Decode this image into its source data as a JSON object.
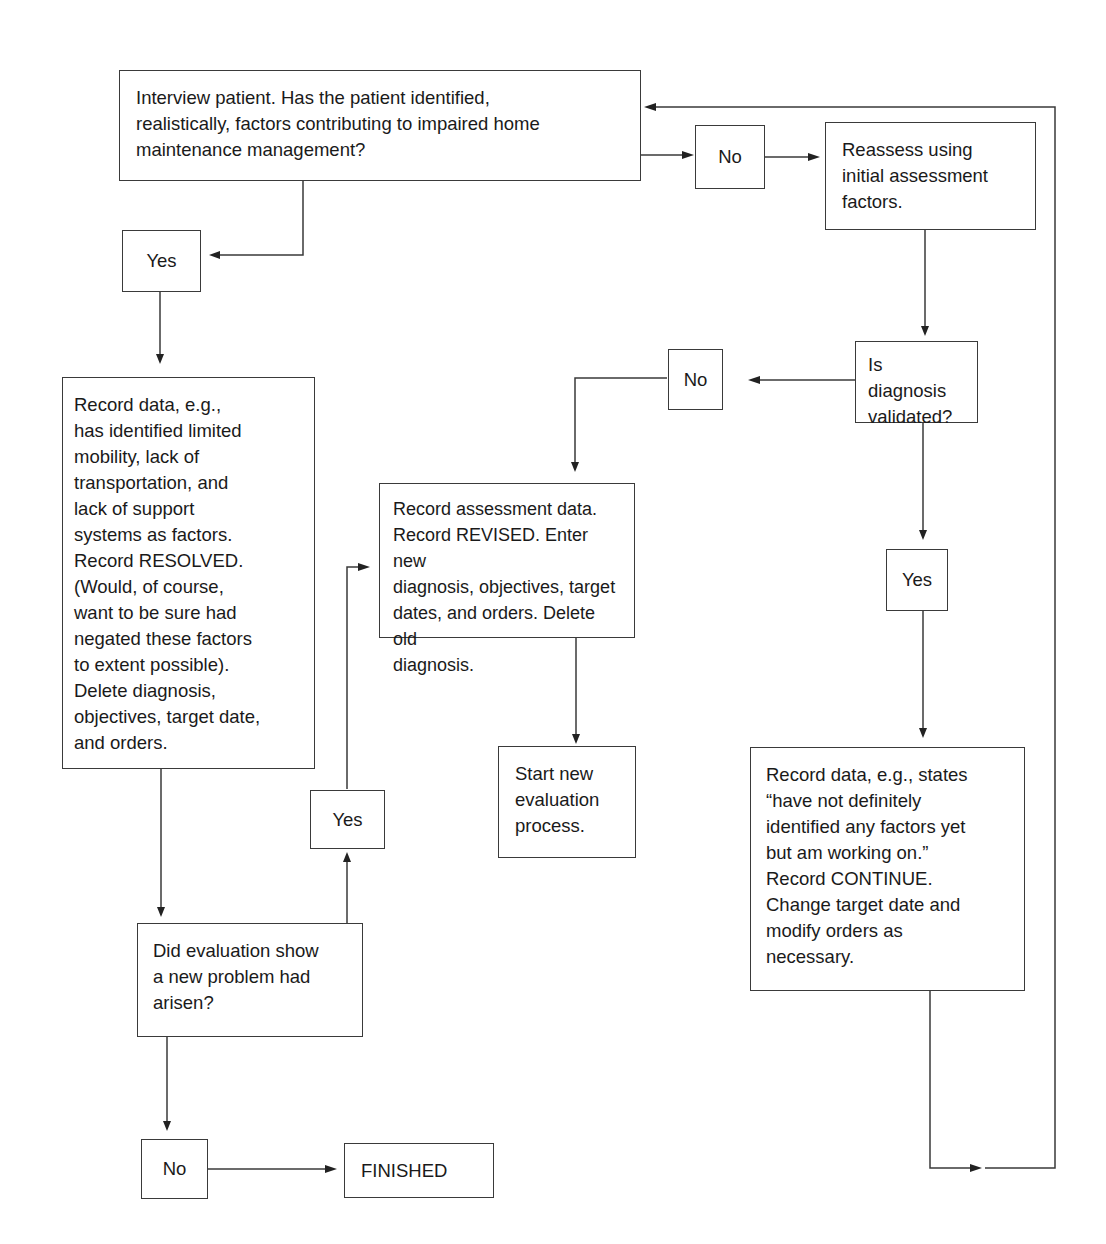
{
  "diagram": {
    "type": "flowchart",
    "nodes": {
      "interview": {
        "text": "Interview patient. Has the patient identified,\nrealistically, factors contributing to impaired home\nmaintenance management?"
      },
      "no_top": {
        "text": "No"
      },
      "reassess": {
        "text": "Reassess using\ninitial assessment\nfactors."
      },
      "yes_top": {
        "text": "Yes"
      },
      "record_resolved": {
        "text": "Record data, e.g.,\nhas identified limited\nmobility, lack of\ntransportation, and\nlack of support\nsystems as factors.\nRecord RESOLVED.\n(Would, of course,\nwant to be sure had\nnegated these factors\nto extent possible).\nDelete diagnosis,\nobjectives, target date,\nand orders."
      },
      "validated": {
        "text": "Is diagnosis\nvalidated?"
      },
      "no_mid": {
        "text": "No"
      },
      "record_revised": {
        "text": "Record assessment data.\nRecord REVISED. Enter new\ndiagnosis, objectives, target\ndates, and orders. Delete old\ndiagnosis."
      },
      "yes_right": {
        "text": "Yes"
      },
      "start_new": {
        "text": "Start new\nevaluation\nprocess."
      },
      "yes_mid": {
        "text": "Yes"
      },
      "record_continue": {
        "text": "Record data, e.g., states\n“have not definitely\nidentified any factors yet\nbut am working on.”\nRecord CONTINUE.\nChange target date and\nmodify orders as\nnecessary."
      },
      "new_problem": {
        "text": "Did evaluation show\na new problem had\narisen?"
      },
      "no_bottom": {
        "text": "No"
      },
      "finished": {
        "text": "FINISHED"
      }
    },
    "edges": [
      {
        "from": "interview",
        "to": "no_top"
      },
      {
        "from": "no_top",
        "to": "reassess"
      },
      {
        "from": "interview",
        "to": "yes_top"
      },
      {
        "from": "yes_top",
        "to": "record_resolved"
      },
      {
        "from": "reassess",
        "to": "validated"
      },
      {
        "from": "validated",
        "to": "no_mid"
      },
      {
        "from": "no_mid",
        "to": "record_revised"
      },
      {
        "from": "validated",
        "to": "yes_right"
      },
      {
        "from": "yes_right",
        "to": "record_continue"
      },
      {
        "from": "record_revised",
        "to": "start_new"
      },
      {
        "from": "record_resolved",
        "to": "new_problem"
      },
      {
        "from": "new_problem",
        "to": "yes_mid"
      },
      {
        "from": "yes_mid",
        "to": "record_revised"
      },
      {
        "from": "new_problem",
        "to": "no_bottom"
      },
      {
        "from": "no_bottom",
        "to": "finished"
      },
      {
        "from": "record_continue",
        "to": "interview"
      }
    ]
  }
}
